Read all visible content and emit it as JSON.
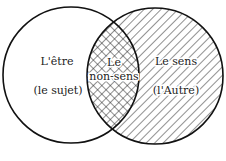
{
  "diagram": {
    "type": "venn",
    "left_set": {
      "title": "L'être",
      "subtitle": "(le sujet)",
      "fill": "none"
    },
    "right_set": {
      "title": "Le sens",
      "subtitle": "(l'Autre)",
      "fill": "diagonal-hatch"
    },
    "intersection": {
      "line1": "Le",
      "line2": "non-sens",
      "fill": "cross-hatch"
    },
    "colors": {
      "stroke": "#111111",
      "background": "#ffffff"
    }
  }
}
